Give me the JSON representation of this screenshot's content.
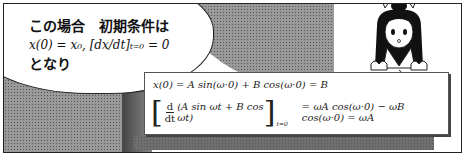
{
  "speech_bubble": {
    "line1": "この場合　初期条件は",
    "line2": "x(0) = x₀,  [dx/dt]ₜ₌₀ = 0",
    "line3": "となり"
  },
  "board": {
    "equation1": "x(0) = A sin(ω·0) + B cos(ω·0) = B",
    "equation2": {
      "deriv_num": "d",
      "deriv_den": "dt",
      "expression": "(A sin ωt + B cos ωt)",
      "bracket_sub": "t=0",
      "rhs": "= ωA cos(ω·0) − ωB cos(ω·0) = ωA"
    }
  },
  "illustration": {
    "character": "girl-with-ribbon-peeking-over-board"
  }
}
